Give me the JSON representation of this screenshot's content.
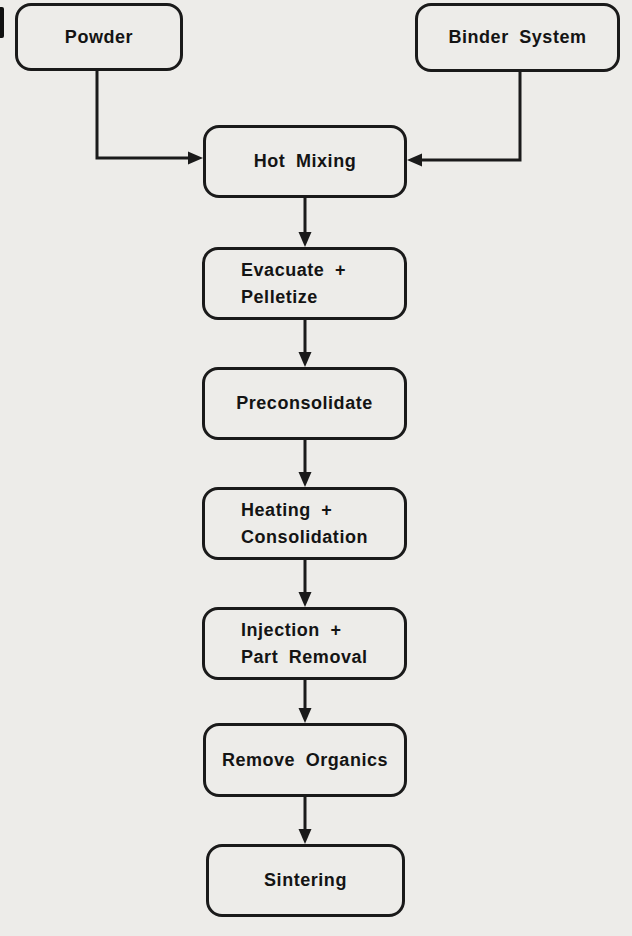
{
  "colors": {
    "background": "#edece9",
    "line": "#1a1a1a",
    "text": "#141414"
  },
  "flowchart": {
    "nodes": [
      {
        "id": "powder",
        "label": "Powder"
      },
      {
        "id": "binder-system",
        "label": "Binder System"
      },
      {
        "id": "hot-mixing",
        "label": "Hot Mixing"
      },
      {
        "id": "evacuate-pelletize",
        "label": "Evacuate +\nPelletize"
      },
      {
        "id": "preconsolidate",
        "label": "Preconsolidate"
      },
      {
        "id": "heating-consolidation",
        "label": "Heating +\nConsolidation"
      },
      {
        "id": "injection-part-removal",
        "label": "Injection +\nPart Removal"
      },
      {
        "id": "remove-organics",
        "label": "Remove Organics"
      },
      {
        "id": "sintering",
        "label": "Sintering"
      }
    ],
    "edges": [
      {
        "from": "Powder",
        "to": "Hot Mixing"
      },
      {
        "from": "Binder System",
        "to": "Hot Mixing"
      },
      {
        "from": "Hot Mixing",
        "to": "Evacuate + Pelletize"
      },
      {
        "from": "Evacuate + Pelletize",
        "to": "Preconsolidate"
      },
      {
        "from": "Preconsolidate",
        "to": "Heating + Consolidation"
      },
      {
        "from": "Heating + Consolidation",
        "to": "Injection + Part Removal"
      },
      {
        "from": "Injection + Part Removal",
        "to": "Remove Organics"
      },
      {
        "from": "Remove Organics",
        "to": "Sintering"
      }
    ]
  }
}
